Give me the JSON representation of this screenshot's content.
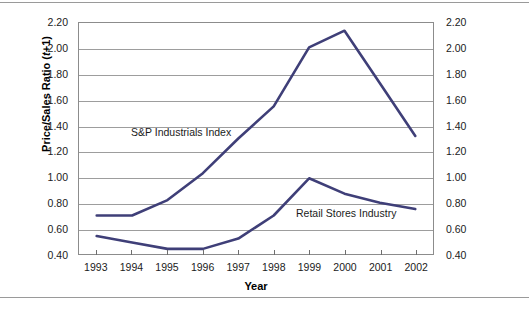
{
  "figure": {
    "width": 529,
    "height": 313,
    "background": "#ffffff"
  },
  "axis": {
    "y_label_html": "Price/Sales Ratio (t+1)",
    "y_label_prefix": "Price/Sales Ratio (",
    "y_label_italic": "t",
    "y_label_suffix": "+1)",
    "x_label": "Year"
  },
  "annotations": {
    "sp": "S&P Industrials Index",
    "retail": "Retail Stores Industry"
  },
  "colors": {
    "line": "#3f3f78",
    "grid": "#9d9d9d",
    "frame": "#8c8c8c",
    "text": "#1b1b1b",
    "rule": "#9a9a9a"
  },
  "chart_data": {
    "type": "line",
    "title": "",
    "xlabel": "Year",
    "ylabel": "Price/Sales Ratio (t+1)",
    "categories": [
      "1993",
      "1994",
      "1995",
      "1996",
      "1997",
      "1998",
      "1999",
      "2000",
      "2001",
      "2002"
    ],
    "x": [
      1993,
      1994,
      1995,
      1996,
      1997,
      1998,
      1999,
      2000,
      2001,
      2002
    ],
    "ylim": [
      0.4,
      2.2
    ],
    "yticks": [
      0.4,
      0.6,
      0.8,
      1.0,
      1.2,
      1.4,
      1.6,
      1.8,
      2.0,
      2.2
    ],
    "ytick_labels": [
      "0.40",
      "0.60",
      "0.80",
      "1.00",
      "1.20",
      "1.40",
      "1.60",
      "1.80",
      "2.00",
      "2.20"
    ],
    "dual_y_axis": true,
    "grid": true,
    "grid_axis": "y",
    "legend": "inline-annotations",
    "series": [
      {
        "name": "S&P Industrials Index",
        "color": "#3f3f78",
        "values": [
          0.7,
          0.7,
          0.82,
          1.03,
          1.3,
          1.55,
          2.01,
          2.14,
          1.73,
          1.32
        ]
      },
      {
        "name": "Retail Stores Industry",
        "color": "#3f3f78",
        "values": [
          0.54,
          0.49,
          0.44,
          0.44,
          0.52,
          0.7,
          0.99,
          0.87,
          0.8,
          0.75
        ]
      }
    ]
  }
}
